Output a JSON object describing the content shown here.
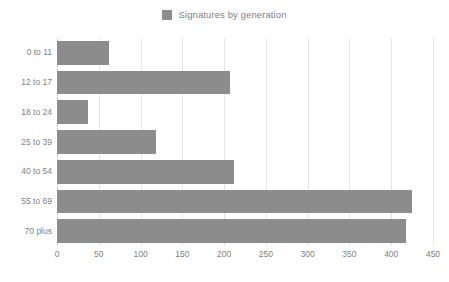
{
  "chart_data": {
    "type": "bar",
    "orientation": "horizontal",
    "title": "",
    "subtitle": "",
    "xlabel": "",
    "ylabel": "",
    "categories": [
      "0 to 11",
      "12 to 17",
      "18 to 24",
      "25 to 39",
      "40 to 54",
      "55 to 69",
      "70 plus"
    ],
    "series": [
      {
        "name": "Signatures by generation",
        "values": [
          62,
          207,
          37,
          118,
          212,
          425,
          418
        ],
        "color": "#8c8c8c"
      }
    ],
    "xlim": [
      0,
      450
    ],
    "xticks": [
      0,
      50,
      100,
      150,
      200,
      250,
      300,
      350,
      400,
      450
    ],
    "xtick_labels": [
      "0",
      "50",
      "100",
      "150",
      "200",
      "250",
      "300",
      "350",
      "400",
      "450"
    ],
    "grid": "vertical",
    "legend": {
      "position": "top-center",
      "entries": [
        {
          "label": "Signatures by generation",
          "color": "#8c8c8c",
          "swatch": "legend-swatch-icon"
        }
      ]
    },
    "background": "#ffffff",
    "text_color": "#7f7f7f",
    "gridline_color": "#e6e6e6"
  }
}
